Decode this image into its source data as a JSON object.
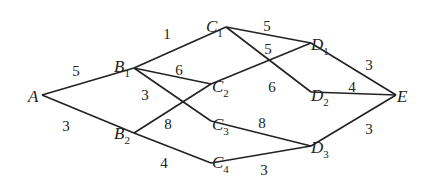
{
  "diagram": {
    "type": "weighted-network",
    "nodes": [
      {
        "id": "A",
        "letter": "A",
        "sub": "",
        "x": 28,
        "y": 102,
        "vx": 42,
        "vy": 95
      },
      {
        "id": "B1",
        "letter": "B",
        "sub": "1",
        "x": 114,
        "y": 72,
        "vx": 134,
        "vy": 68
      },
      {
        "id": "B2",
        "letter": "B",
        "sub": "2",
        "x": 114,
        "y": 139,
        "vx": 134,
        "vy": 133
      },
      {
        "id": "C1",
        "letter": "C",
        "sub": "1",
        "x": 206,
        "y": 32,
        "vx": 226,
        "vy": 27
      },
      {
        "id": "C2",
        "letter": "C",
        "sub": "2",
        "x": 212,
        "y": 92,
        "vx": 211,
        "vy": 84
      },
      {
        "id": "C3",
        "letter": "C",
        "sub": "3",
        "x": 212,
        "y": 130,
        "vx": 211,
        "vy": 121
      },
      {
        "id": "C4",
        "letter": "C",
        "sub": "4",
        "x": 212,
        "y": 168,
        "vx": 211,
        "vy": 163
      },
      {
        "id": "D1",
        "letter": "D",
        "sub": "1",
        "x": 311,
        "y": 50,
        "vx": 311,
        "vy": 43
      },
      {
        "id": "D2",
        "letter": "D",
        "sub": "2",
        "x": 311,
        "y": 101,
        "vx": 311,
        "vy": 92
      },
      {
        "id": "D3",
        "letter": "D",
        "sub": "3",
        "x": 311,
        "y": 153,
        "vx": 311,
        "vy": 146
      },
      {
        "id": "E",
        "letter": "E",
        "sub": "",
        "x": 397,
        "y": 102,
        "vx": 396,
        "vy": 95
      }
    ],
    "edges": [
      {
        "from": "A",
        "to": "B1",
        "weight": "5",
        "lx": 76,
        "ly": 76
      },
      {
        "from": "A",
        "to": "B2",
        "weight": "3",
        "lx": 66,
        "ly": 131
      },
      {
        "from": "B1",
        "to": "C1",
        "weight": "1",
        "lx": 167,
        "ly": 39
      },
      {
        "from": "B1",
        "to": "C2",
        "weight": "6",
        "lx": 179,
        "ly": 75
      },
      {
        "from": "B1",
        "to": "C3",
        "weight": "3",
        "lx": 145,
        "ly": 100
      },
      {
        "from": "B2",
        "to": "C2",
        "weight": "8",
        "lx": 168,
        "ly": 129
      },
      {
        "from": "B2",
        "to": "C4",
        "weight": "4",
        "lx": 164,
        "ly": 168
      },
      {
        "from": "C1",
        "to": "D1",
        "weight": "5",
        "lx": 267,
        "ly": 31
      },
      {
        "from": "C1",
        "to": "D2",
        "weight": "6",
        "lx": 272,
        "ly": 92
      },
      {
        "from": "C2",
        "to": "D1",
        "weight": "5",
        "lx": 268,
        "ly": 54
      },
      {
        "from": "C3",
        "to": "D3",
        "weight": "8",
        "lx": 262,
        "ly": 128
      },
      {
        "from": "C4",
        "to": "D3",
        "weight": "3",
        "lx": 264,
        "ly": 175
      },
      {
        "from": "D1",
        "to": "E",
        "weight": "3",
        "lx": 369,
        "ly": 70
      },
      {
        "from": "D2",
        "to": "E",
        "weight": "4",
        "lx": 352,
        "ly": 92
      },
      {
        "from": "D3",
        "to": "E",
        "weight": "3",
        "lx": 369,
        "ly": 134
      }
    ]
  }
}
